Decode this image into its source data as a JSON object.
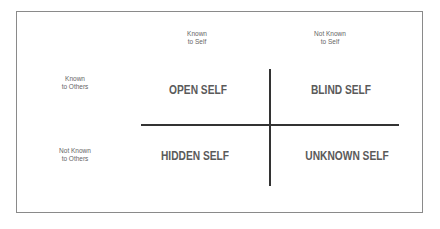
{
  "columns": [
    {
      "line1": "Known",
      "line2": "to Self"
    },
    {
      "line1": "Not Known",
      "line2": "to Self"
    }
  ],
  "rows": [
    {
      "line1": "Known",
      "line2": "to Others"
    },
    {
      "line1": "Not Known",
      "line2": "to Others"
    }
  ],
  "quadrants": {
    "open": "OPEN SELF",
    "blind": "BLIND SELF",
    "hidden": "HIDDEN SELF",
    "unknown": "UNKNOWN SELF"
  },
  "colors": {
    "border": "#8a8a8a",
    "line": "#333333",
    "text": "#5a5a5a"
  }
}
